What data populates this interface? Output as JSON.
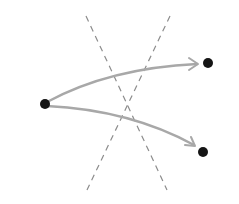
{
  "diagram": {
    "width": 239,
    "height": 204,
    "background": "#ffffff",
    "points": [
      {
        "id": "source",
        "x": 45,
        "y": 104,
        "r": 5,
        "color": "#151515"
      },
      {
        "id": "target-top",
        "x": 208,
        "y": 63,
        "r": 5,
        "color": "#151515"
      },
      {
        "id": "target-bottom",
        "x": 203,
        "y": 152,
        "r": 5,
        "color": "#151515"
      }
    ],
    "arrows": [
      {
        "id": "arrow-top",
        "from": "source",
        "to": "target-top",
        "path": "M47 102 Q110 68 197 64",
        "head": "M189 58 L198 64 L189 70",
        "color": "#a8a8a8"
      },
      {
        "id": "arrow-bottom",
        "from": "source",
        "to": "target-bottom",
        "path": "M47 106 Q130 110 194 145",
        "head": "M185 145 L195 146 L191 137",
        "color": "#a8a8a8"
      }
    ],
    "dashed_lines": [
      {
        "id": "dashed-line-a",
        "x1": 86,
        "y1": 16,
        "x2": 167,
        "y2": 190,
        "color": "#8c8c8c"
      },
      {
        "id": "dashed-line-b",
        "x1": 170,
        "y1": 16,
        "x2": 87,
        "y2": 190,
        "color": "#8c8c8c"
      }
    ]
  }
}
